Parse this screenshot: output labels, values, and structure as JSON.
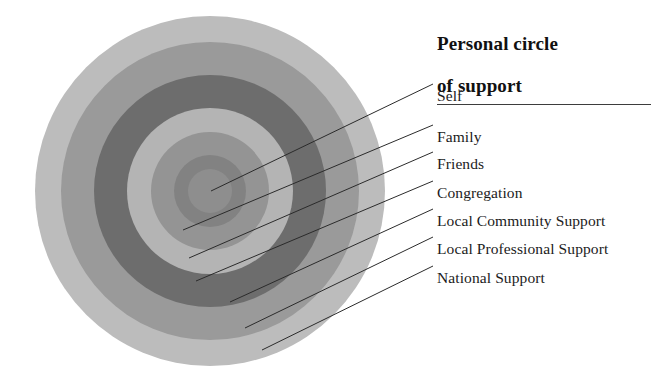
{
  "legend": {
    "title": "Personal circle\nof support",
    "title_line1": "Personal circle",
    "title_line2": "of support",
    "labels": [
      {
        "text": "Self",
        "y": 88
      },
      {
        "text": "Family",
        "y": 129
      },
      {
        "text": "Friends",
        "y": 156
      },
      {
        "text": "Congregation",
        "y": 185
      },
      {
        "text": "Local Community Support",
        "y": 213
      },
      {
        "text": "Local Professional Support",
        "y": 241
      },
      {
        "text": "National Support",
        "y": 270
      }
    ]
  },
  "chart_data": {
    "type": "pie",
    "title": "Personal circle of support",
    "center": {
      "x": 210,
      "y": 191
    },
    "categories": [
      "Self",
      "Family",
      "Friends",
      "Congregation",
      "Local Community Support",
      "Local Professional Support",
      "National Support"
    ],
    "rings": [
      {
        "label": "National Support",
        "order": 7,
        "radius": 175,
        "color": "#bcbcbc"
      },
      {
        "label": "Local Professional Support",
        "order": 6,
        "radius": 149,
        "color": "#9a9a9a"
      },
      {
        "label": "Local Community Support",
        "order": 5,
        "radius": 116,
        "color": "#6d6d6d"
      },
      {
        "label": "Congregation",
        "order": 4,
        "radius": 83,
        "color": "#b4b4b4"
      },
      {
        "label": "Friends",
        "order": 3,
        "radius": 59,
        "color": "#949494"
      },
      {
        "label": "Family",
        "order": 2,
        "radius": 36,
        "color": "#828282"
      },
      {
        "label": "Self",
        "order": 1,
        "radius": 22,
        "color": "#8e8e8e"
      }
    ],
    "leaders": [
      {
        "label": "Self",
        "x1": 211,
        "y1": 191,
        "x2": 433,
        "y2": 84
      },
      {
        "label": "Family",
        "x1": 183,
        "y1": 230,
        "x2": 433,
        "y2": 125
      },
      {
        "label": "Friends",
        "x1": 189,
        "y1": 258,
        "x2": 433,
        "y2": 152
      },
      {
        "label": "Congregation",
        "x1": 196,
        "y1": 281,
        "x2": 433,
        "y2": 181
      },
      {
        "label": "Local Community Support",
        "x1": 230,
        "y1": 302,
        "x2": 433,
        "y2": 209
      },
      {
        "label": "Local Professional Support",
        "x1": 245,
        "y1": 328,
        "x2": 433,
        "y2": 237
      },
      {
        "label": "National Support",
        "x1": 262,
        "y1": 350,
        "x2": 433,
        "y2": 266
      }
    ],
    "line_color": "#2b2b2b",
    "background": "#ffffff"
  }
}
